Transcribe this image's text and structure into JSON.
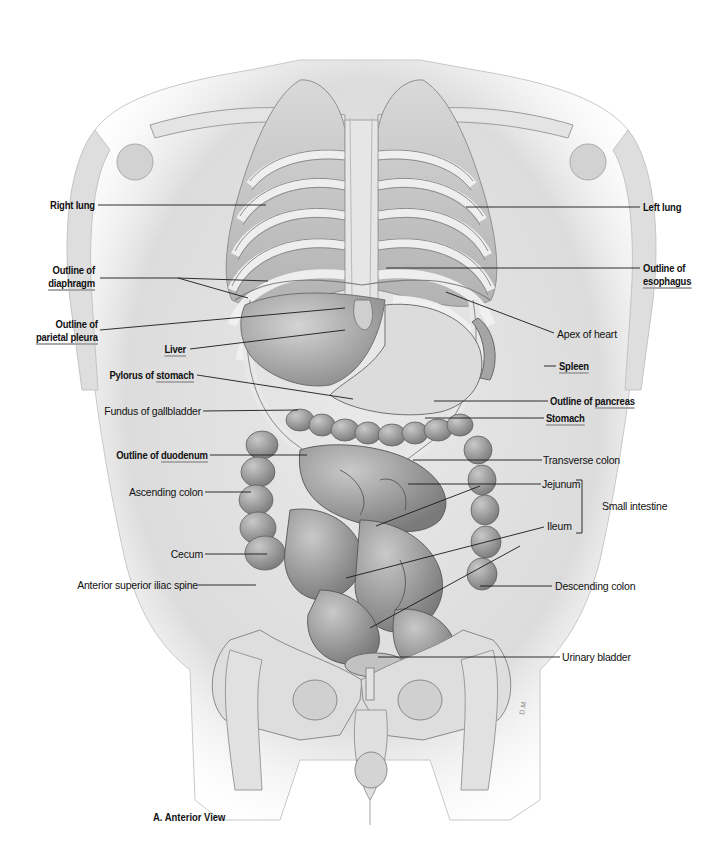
{
  "figure": {
    "caption": "A. Anterior View",
    "signature": "D.M"
  },
  "labels_left": [
    {
      "id": "right-lung",
      "line1": "Right lung",
      "line2": "",
      "bold": true,
      "underline_word": ""
    },
    {
      "id": "outline-diaphragm",
      "line1": "Outline of",
      "line2": "diaphragm",
      "bold": true,
      "underline_word": "diaphragm"
    },
    {
      "id": "outline-parietal-pleura",
      "line1": "Outline of",
      "line2": "parietal pleura",
      "bold": true,
      "underline_word": "parietal pleura"
    },
    {
      "id": "liver",
      "line1": "Liver",
      "line2": "",
      "bold": true,
      "underline_word": "Liver"
    },
    {
      "id": "pylorus-of-stomach",
      "prefix": "Pylorus of ",
      "word": "stomach",
      "bold": true
    },
    {
      "id": "fundus-of-gallbladder",
      "line1": "Fundus of gallbladder",
      "bold": false
    },
    {
      "id": "outline-of-duodenum",
      "prefix": "Outline of ",
      "word": "duodenum",
      "bold": true
    },
    {
      "id": "ascending-colon",
      "line1": "Ascending colon",
      "bold": false
    },
    {
      "id": "cecum",
      "line1": "Cecum",
      "bold": false
    },
    {
      "id": "anterior-superior-iliac-spine",
      "line1": "Anterior superior iliac spine",
      "bold": false
    }
  ],
  "labels_right": [
    {
      "id": "left-lung",
      "line1": "Left lung",
      "bold": true
    },
    {
      "id": "outline-esophagus",
      "line1": "Outline of",
      "line2": "esophagus",
      "bold": true,
      "underline_word": "esophagus"
    },
    {
      "id": "apex-of-heart",
      "line1": "Apex of heart",
      "bold": false
    },
    {
      "id": "spleen",
      "line1": "Spleen",
      "bold": true,
      "underline_word": "Spleen"
    },
    {
      "id": "outline-of-pancreas",
      "prefix": "Outline of ",
      "word": "pancreas",
      "bold": true
    },
    {
      "id": "stomach",
      "line1": "Stomach",
      "bold": true,
      "underline_word": "Stomach"
    },
    {
      "id": "transverse-colon",
      "line1": "Transverse colon",
      "bold": false
    },
    {
      "id": "jejunum",
      "line1": "Jejunum",
      "bold": false
    },
    {
      "id": "small-intestine",
      "line1": "Small intestine",
      "bold": false
    },
    {
      "id": "ileum",
      "line1": "Ileum",
      "bold": false
    },
    {
      "id": "descending-colon",
      "line1": "Descending colon",
      "bold": false
    },
    {
      "id": "urinary-bladder",
      "line1": "Urinary bladder",
      "bold": false
    }
  ],
  "colors": {
    "leader_line": "#1a1a1a",
    "underline": "#a9a9a9",
    "illustration_gray": "#9a9a9a",
    "background": "#ffffff"
  }
}
